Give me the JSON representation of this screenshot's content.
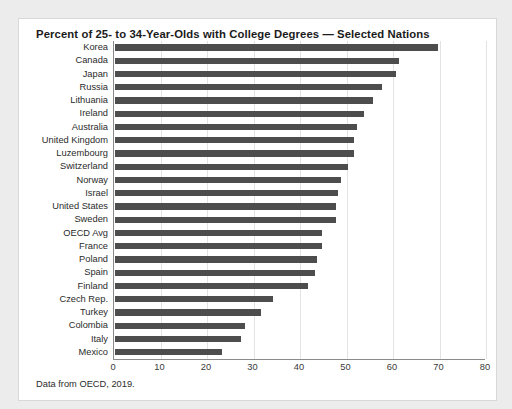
{
  "card": {
    "background_color": "#ffffff",
    "border_color": "#d8d8d8",
    "page_background_color": "#ececed"
  },
  "caption": "Data from OECD, 2019.",
  "chart_data": {
    "type": "bar",
    "orientation": "horizontal",
    "title": "Percent of 25- to 34-Year-Olds with College Degrees — Selected Nations",
    "xlabel": "",
    "ylabel": "",
    "xlim": [
      0,
      80
    ],
    "xticks": [
      0,
      10,
      20,
      30,
      40,
      50,
      60,
      70,
      80
    ],
    "grid": true,
    "grid_axis": "x",
    "legend": null,
    "bar_color": "#4d4d4d",
    "categories": [
      "Korea",
      "Canada",
      "Japan",
      "Russia",
      "Lithuania",
      "Ireland",
      "Australia",
      "United Kingdom",
      "Luzembourg",
      "Switzerland",
      "Norway",
      "Israel",
      "United States",
      "Sweden",
      "OECD Avg",
      "France",
      "Poland",
      "Spain",
      "Finland",
      "Czech Rep.",
      "Turkey",
      "Colombia",
      "Italy",
      "Mexico"
    ],
    "values": [
      69.5,
      61.0,
      60.5,
      57.5,
      55.5,
      53.5,
      52.0,
      51.5,
      51.5,
      50.0,
      48.5,
      48.0,
      47.5,
      47.5,
      44.5,
      44.5,
      43.5,
      43.0,
      41.5,
      34.0,
      31.5,
      28.0,
      27.0,
      23.0
    ]
  }
}
